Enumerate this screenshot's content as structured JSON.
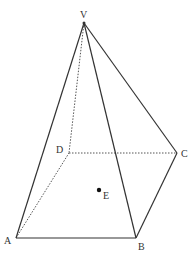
{
  "diagram": {
    "type": "square-based pyramid",
    "vertices": {
      "V": {
        "label": "V",
        "x": 84,
        "y": 23
      },
      "A": {
        "label": "A",
        "x": 16,
        "y": 238
      },
      "B": {
        "label": "B",
        "x": 136,
        "y": 238
      },
      "C": {
        "label": "C",
        "x": 177,
        "y": 153
      },
      "D": {
        "label": "D",
        "x": 69,
        "y": 153
      }
    },
    "point": {
      "label": "E",
      "x": 99,
      "y": 190
    },
    "edges_solid": [
      "VA",
      "VB",
      "VC",
      "AB",
      "BC"
    ],
    "edges_hidden": [
      "VD",
      "AD",
      "DC"
    ],
    "line_color": "#333333"
  }
}
